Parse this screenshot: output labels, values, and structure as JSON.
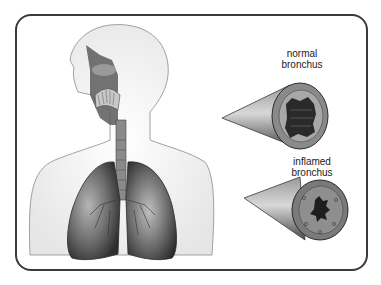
{
  "diagram": {
    "labels": {
      "normal": [
        "normal",
        "bronchus"
      ],
      "inflamed": [
        "inflamed",
        "bronchus"
      ]
    },
    "colors": {
      "frame_border": "#3a3a3a",
      "background": "#ffffff",
      "lung_dark": "#3c3c3c",
      "lung_light": "#9a9a9a",
      "bronchus_wall": "#7a7a7a"
    }
  }
}
